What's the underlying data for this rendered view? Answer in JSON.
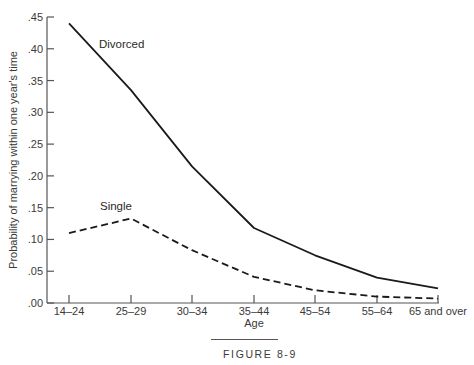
{
  "chart_data": {
    "type": "line",
    "title": "",
    "caption": "FIGURE 8-9",
    "xlabel": "Age",
    "ylabel": "Probability of marrying within one year's time",
    "categories": [
      "14–24",
      "25–29",
      "30–34",
      "35–44",
      "45–54",
      "55–64",
      "65 and over"
    ],
    "yticks": [
      ".00",
      ".05",
      ".10",
      ".15",
      ".20",
      ".25",
      ".30",
      ".35",
      ".40",
      ".45"
    ],
    "ylim": [
      0,
      0.45
    ],
    "grid": false,
    "legend": "inline labels",
    "series": [
      {
        "name": "Divorced",
        "style": "solid",
        "values": [
          0.44,
          0.335,
          0.215,
          0.118,
          0.075,
          0.04,
          0.023
        ]
      },
      {
        "name": "Single",
        "style": "dashed",
        "values": [
          0.11,
          0.133,
          0.083,
          0.041,
          0.02,
          0.01,
          0.007
        ]
      }
    ]
  }
}
